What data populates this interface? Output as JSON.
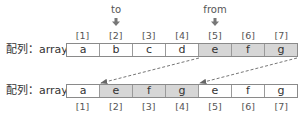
{
  "diagram": {
    "pointers": [
      {
        "label": "to",
        "index": 2
      },
      {
        "label": "from",
        "index": 5
      }
    ],
    "top_row": {
      "label": "配列：array",
      "indices": [
        "[1]",
        "[2]",
        "[3]",
        "[4]",
        "[5]",
        "[6]",
        "[7]"
      ],
      "cells": [
        {
          "value": "a",
          "shaded": false
        },
        {
          "value": "b",
          "shaded": false
        },
        {
          "value": "c",
          "shaded": false
        },
        {
          "value": "d",
          "shaded": false
        },
        {
          "value": "e",
          "shaded": true
        },
        {
          "value": "f",
          "shaded": true
        },
        {
          "value": "g",
          "shaded": true
        }
      ]
    },
    "bottom_row": {
      "label": "配列：array",
      "indices": [
        "[1]",
        "[2]",
        "[3]",
        "[4]",
        "[5]",
        "[6]",
        "[7]"
      ],
      "cells": [
        {
          "value": "a",
          "shaded": false
        },
        {
          "value": "e",
          "shaded": true
        },
        {
          "value": "f",
          "shaded": true
        },
        {
          "value": "g",
          "shaded": true
        },
        {
          "value": "e",
          "shaded": false
        },
        {
          "value": "f",
          "shaded": false
        },
        {
          "value": "g",
          "shaded": false
        }
      ]
    },
    "move_arrows": [
      {
        "from": "top [5] left edge",
        "to": "bottom [2] left edge",
        "style": "dashed"
      },
      {
        "from": "top [7] right edge",
        "to": "bottom [4] right edge",
        "style": "dashed"
      }
    ],
    "colors": {
      "shaded_cell": "#d6d6d6",
      "border": "#8a8a8a",
      "text": "#333333",
      "arrow": "#666666"
    }
  }
}
